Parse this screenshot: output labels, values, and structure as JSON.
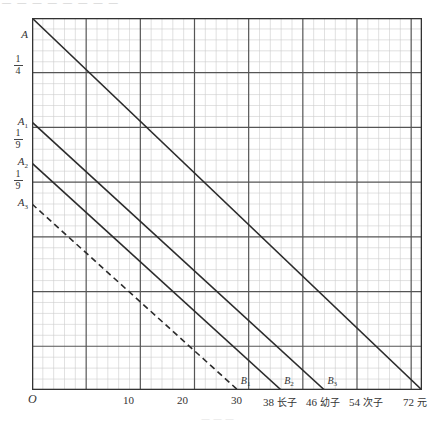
{
  "header": {
    "faint_text": "— — — — — — — —"
  },
  "footer": {
    "faint_text": "— — —"
  },
  "axes": {
    "origin_label": "O",
    "y_labels": [
      {
        "text": "A",
        "sub": "",
        "y": 35
      },
      {
        "text": "A",
        "sub": "1",
        "y": 122
      },
      {
        "text": "A",
        "sub": "2",
        "y": 162
      },
      {
        "text": "A",
        "sub": "3",
        "y": 203
      }
    ],
    "y_fractions": [
      {
        "num": "1",
        "den": "4",
        "y": 62
      },
      {
        "num": "1",
        "den": "9",
        "y": 136
      },
      {
        "num": "1",
        "den": "9",
        "y": 177
      }
    ],
    "x_ticks": [
      {
        "value": "10",
        "cn": "",
        "x": 132
      },
      {
        "value": "20",
        "cn": "",
        "x": 186
      },
      {
        "value": "30",
        "cn": "",
        "x": 240
      },
      {
        "value": "38",
        "cn": "长子",
        "x": 272
      },
      {
        "value": "46",
        "cn": "幼子",
        "x": 315
      },
      {
        "value": "54",
        "cn": "次子",
        "x": 358
      },
      {
        "value": "72",
        "cn": "元",
        "x": 412
      }
    ]
  },
  "chart_data": {
    "type": "line",
    "title": "",
    "xlabel": "元",
    "ylabel": "",
    "xlim": [
      0,
      72
    ],
    "ylim": [
      0,
      1
    ],
    "grid": true,
    "minor_grid": true,
    "legend": "none",
    "x_tick_values": [
      0,
      10,
      20,
      30,
      38,
      46,
      54,
      72
    ],
    "x_tick_labels": [
      "O",
      "10",
      "20",
      "30",
      "38 长子",
      "46 幼子",
      "54 次子",
      "72 元"
    ],
    "y_tick_labels": [
      "A",
      "1/4",
      "A1",
      "1/9",
      "A2",
      "1/9",
      "A3"
    ],
    "series": [
      {
        "name": "A-B",
        "style": "solid",
        "points": [
          {
            "x": 0,
            "y": 1.0
          },
          {
            "x": 72,
            "y": 0.0
          }
        ],
        "start_label": "A",
        "end_label": "B"
      },
      {
        "name": "A1-B3",
        "style": "solid",
        "points": [
          {
            "x": 0,
            "y": 0.72
          },
          {
            "x": 54,
            "y": 0.0
          }
        ],
        "start_label": "A1",
        "end_label": "B3"
      },
      {
        "name": "A2-B2",
        "style": "solid",
        "points": [
          {
            "x": 0,
            "y": 0.61
          },
          {
            "x": 46,
            "y": 0.0
          }
        ],
        "start_label": "A2",
        "end_label": "B2"
      },
      {
        "name": "A3-B1",
        "style": "dashed",
        "points": [
          {
            "x": 0,
            "y": 0.5
          },
          {
            "x": 38,
            "y": 0.0
          }
        ],
        "start_label": "A3",
        "end_label": "B1"
      }
    ],
    "point_labels": [
      {
        "text": "B",
        "sub": "1",
        "x": 38,
        "y": 0.0
      },
      {
        "text": "B",
        "sub": "2",
        "x": 46,
        "y": 0.0
      },
      {
        "text": "B",
        "sub": "3",
        "x": 54,
        "y": 0.0
      },
      {
        "text": "B",
        "sub": "",
        "x": 72,
        "y": 0.0
      }
    ]
  },
  "colors": {
    "line": "#2b2b2b",
    "major_grid": "#555555",
    "minor_grid": "#cccccc",
    "frame": "#333333",
    "text": "#333333"
  }
}
